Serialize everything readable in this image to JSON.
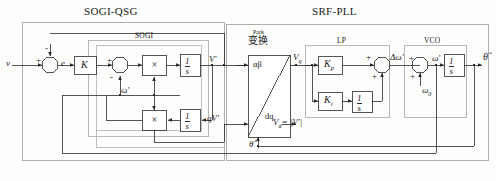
{
  "figure": {
    "type": "control-block-diagram"
  },
  "sections": {
    "sogi_qsg_title": "SOGI-QSG",
    "srf_pll_title": "SRF-PLL",
    "sogi_group": "SOGI",
    "lp_group": "LP",
    "vco_group": "VCO",
    "park_label_en": "Park",
    "park_label_cn": "变换"
  },
  "signals": {
    "input_v": "v",
    "error_e": "e",
    "omega_prime_sogi": "ω'",
    "v_prime": "V'",
    "qv_prime": "qV'",
    "v_q": "V",
    "v_q_sub": "q",
    "v_d": "V",
    "v_d_sub": "d",
    "v_d_expr": "= |V'|",
    "delta_omega": "Δω'",
    "omega_prime": "ω'",
    "omega_zero": "ω",
    "omega_zero_sub": "0",
    "theta_hat_out": "θ̂",
    "theta_hat_fb": "θ̂",
    "alpha_beta": "αβ",
    "dq": "dq"
  },
  "blocks": {
    "gain_k": "K",
    "mult_1": "×",
    "mult_2": "×",
    "integrator_1_num": "1",
    "integrator_1_den": "s",
    "integrator_2_num": "1",
    "integrator_2_den": "s",
    "kp": "K",
    "kp_sub": "p",
    "ki": "K",
    "ki_sub": "i",
    "integrator_lp_num": "1",
    "integrator_lp_den": "s",
    "integrator_vco_num": "1",
    "integrator_vco_den": "s"
  },
  "signs": {
    "sum1_plus": "+",
    "sum1_minus": "-",
    "sum2_plus": "+",
    "sum2_minus": "-",
    "lp_sum_plus_top": "+",
    "lp_sum_plus_bottom": "+",
    "vco_sum_plus_left": "+",
    "vco_sum_plus_bottom": "+"
  },
  "colors": {
    "line": "#3a3a3a",
    "frame": "#8a8a8a",
    "group_frame": "#9a9a9a",
    "block_fill": "#ffffff",
    "text": "#1a1a1a",
    "background": "#fdfdfc"
  }
}
